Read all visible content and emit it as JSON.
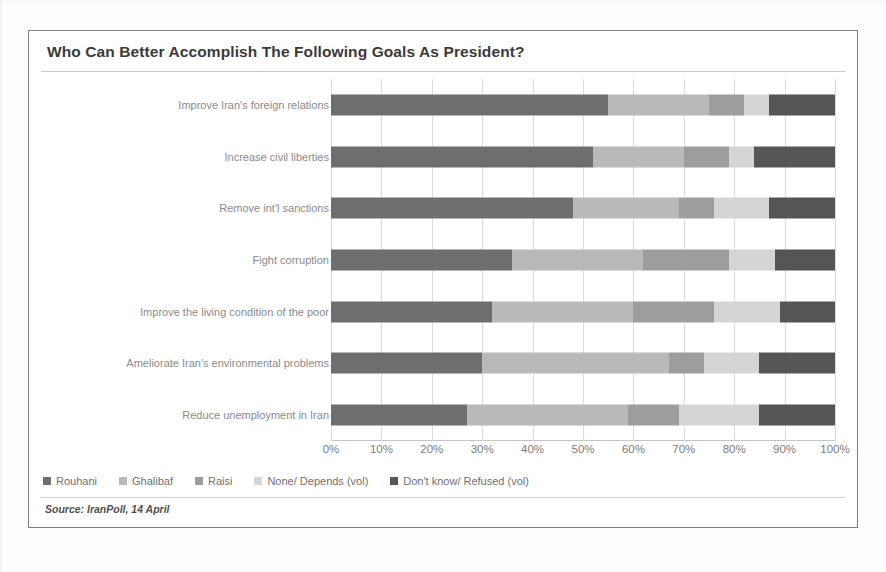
{
  "chart_title": "Who Can Better Accomplish The Following Goals As President?",
  "source_note": "Source: IranPoll, 14 April",
  "legend": {
    "items": [
      {
        "label": "Rouhani",
        "color": "#6e6e6e",
        "icon": "square-swatch-icon"
      },
      {
        "label": "Ghalibaf",
        "color": "#b9b9b9",
        "icon": "square-swatch-icon"
      },
      {
        "label": "Raisi",
        "color": "#9d9d9d",
        "icon": "square-swatch-icon"
      },
      {
        "label": "None/ Depends (vol)",
        "color": "#d5d5d5",
        "icon": "square-swatch-icon"
      },
      {
        "label": "Don't know/ Refused (vol)",
        "color": "#555555",
        "icon": "square-swatch-icon"
      }
    ]
  },
  "chart_data": {
    "type": "bar",
    "orientation": "horizontal",
    "stacked": true,
    "stack_total": 100,
    "title": "Who Can Better Accomplish The Following Goals As President?",
    "xlabel": "",
    "ylabel": "",
    "xlim": [
      0,
      100
    ],
    "xticks": [
      0,
      10,
      20,
      30,
      40,
      50,
      60,
      70,
      80,
      90,
      100
    ],
    "xtick_labels": [
      "0%",
      "10%",
      "20%",
      "30%",
      "40%",
      "50%",
      "60%",
      "70%",
      "80%",
      "90%",
      "100%"
    ],
    "grid": true,
    "legend_position": "bottom-left",
    "categories": [
      "Improve Iran's foreign relations",
      "Increase civil liberties",
      "Remove int'l sanctions",
      "Fight corruption",
      "Improve the living condition of the poor",
      "Ameliorate Iran's environmental problems",
      "Reduce unemployment in Iran"
    ],
    "series": [
      {
        "name": "Rouhani",
        "color": "#6e6e6e",
        "values": [
          55,
          52,
          48,
          36,
          32,
          30,
          27
        ]
      },
      {
        "name": "Ghalibaf",
        "color": "#b9b9b9",
        "values": [
          20,
          18,
          21,
          26,
          28,
          37,
          32
        ]
      },
      {
        "name": "Raisi",
        "color": "#9d9d9d",
        "values": [
          7,
          9,
          7,
          17,
          16,
          7,
          10
        ]
      },
      {
        "name": "None/ Depends (vol)",
        "color": "#d5d5d5",
        "values": [
          5,
          5,
          11,
          9,
          13,
          11,
          16
        ]
      },
      {
        "name": "Don't know/ Refused (vol)",
        "color": "#555555",
        "values": [
          13,
          16,
          13,
          12,
          11,
          15,
          15
        ]
      }
    ]
  }
}
